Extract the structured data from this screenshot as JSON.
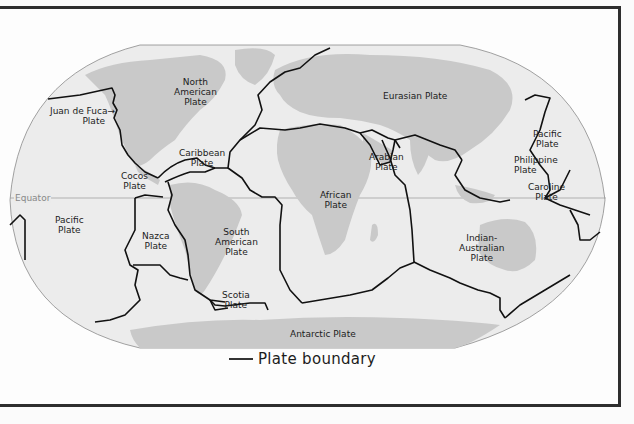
{
  "map": {
    "type": "world tectonic plate map (Robinson-like projection)",
    "equator_label": "Equator",
    "plates": [
      {
        "id": "north-american",
        "lines": [
          "North",
          "American",
          "Plate"
        ]
      },
      {
        "id": "juan-de-fuca",
        "lines": [
          "Juan de Fuca→",
          "Plate"
        ]
      },
      {
        "id": "caribbean",
        "lines": [
          "Caribbean",
          "Plate"
        ]
      },
      {
        "id": "cocos",
        "lines": [
          "Cocos",
          "Plate"
        ]
      },
      {
        "id": "pacific-west",
        "lines": [
          "Pacific",
          "Plate"
        ]
      },
      {
        "id": "nazca",
        "lines": [
          "Nazca",
          "Plate"
        ]
      },
      {
        "id": "south-american",
        "lines": [
          "South",
          "American",
          "Plate"
        ]
      },
      {
        "id": "scotia",
        "lines": [
          "Scotia",
          "Plate"
        ]
      },
      {
        "id": "african",
        "lines": [
          "African",
          "Plate"
        ]
      },
      {
        "id": "eurasian",
        "lines": [
          "Eurasian Plate"
        ]
      },
      {
        "id": "arabian",
        "lines": [
          "Arabian",
          "Plate"
        ]
      },
      {
        "id": "pacific-east",
        "lines": [
          "Pacific",
          "Plate"
        ]
      },
      {
        "id": "philippine",
        "lines": [
          "Philippine",
          "Plate"
        ]
      },
      {
        "id": "caroline",
        "lines": [
          "Caroline",
          "Plate"
        ]
      },
      {
        "id": "indian-australian",
        "lines": [
          "Indian-",
          "Australian",
          "Plate"
        ]
      },
      {
        "id": "antarctic",
        "lines": [
          "Antarctic Plate"
        ]
      }
    ],
    "legend": {
      "label": "Plate boundary"
    },
    "colors": {
      "ocean": "#ececec",
      "land": "#c9c9c9",
      "boundary": "#111111",
      "frame": "#2e2e2e"
    }
  }
}
